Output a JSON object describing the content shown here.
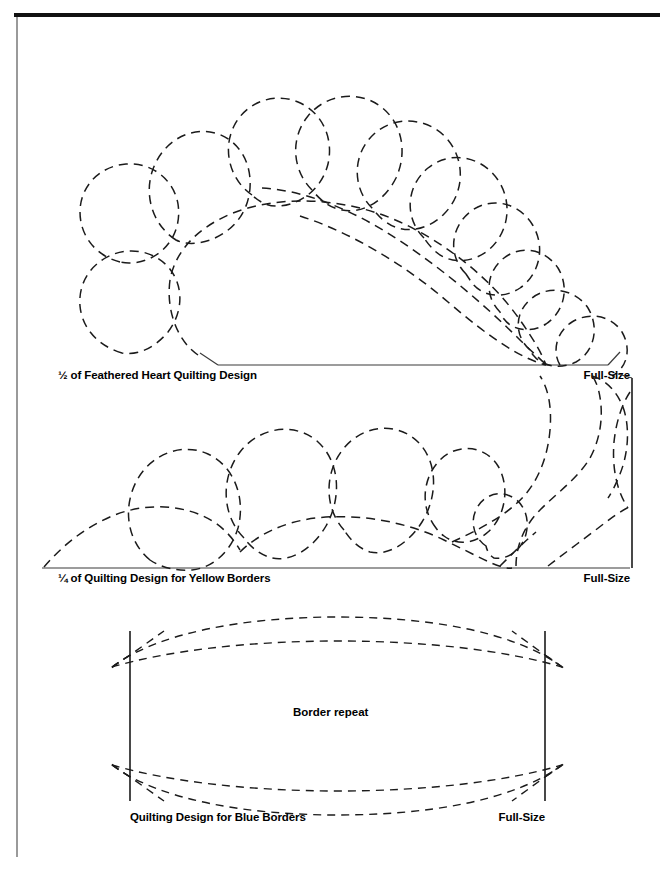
{
  "page": {
    "background_color": "#ffffff",
    "ink_color": "#1b1b1b",
    "rule_color": "#111111",
    "gutter_rule_color": "#9a9a9a"
  },
  "figures": [
    {
      "id": "feathered-heart",
      "caption_left": "½ of Feathered Heart Quilting Design",
      "caption_right": "Full-Size",
      "motif": "feather plume of overlapping teardrop lobes above a straight baseline",
      "line_style": "dashed"
    },
    {
      "id": "yellow-border",
      "caption_left": "¼ of Quilting Design for Yellow Borders",
      "caption_right": "Full-Size",
      "motif": "feather plume of overlapping teardrop lobes ending in a scroll curl at the right corner",
      "line_style": "dashed"
    },
    {
      "id": "blue-border",
      "caption_left": "Quilting Design for Blue Borders",
      "caption_right": "Full-Size",
      "inner_label": "Border repeat",
      "motif": "two nested pointed-oval (vesica) bands crossing between two vertical repeat bars",
      "line_style": "dashed"
    }
  ]
}
